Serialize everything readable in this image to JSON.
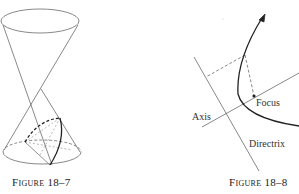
{
  "figures": [
    {
      "caption": "Figure 18–7",
      "description": "Double cone with a parabolic section on the lower nappe"
    },
    {
      "caption": "Figure 18–8",
      "description": "Parabola with focus, axis and directrix",
      "labels": {
        "focus": "Focus",
        "axis": "Axis",
        "directrix": "Directrix"
      }
    }
  ]
}
